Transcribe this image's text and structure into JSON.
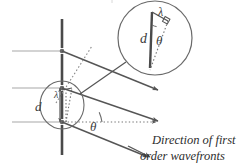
{
  "figure": {
    "kind": "optics-diagram",
    "background_color": "#ffffff",
    "ink_color": "#555555",
    "grating_color": "#4a4a4a",
    "wavefront_color": "#bdbdbd",
    "text_color": "#3c3c3c"
  },
  "labels": {
    "slit_spacing_small": "d",
    "wavelength_small": "λ",
    "slit_spacing_magnified": "d",
    "angle_magnified": "θ",
    "wavelength_magnified": "λ",
    "angle_main": "θ"
  },
  "caption": {
    "line1": "Direction of first",
    "line2": "order wavefronts"
  },
  "geometry": {
    "grating_line": {
      "x": 62,
      "y1": 20,
      "y2": 155
    },
    "slit_points_y": [
      51,
      88,
      122
    ],
    "incoming_wavefronts_y": [
      51,
      88,
      122
    ],
    "incoming_wavefront_x_start": 12,
    "incoming_wavefront_x_end": 62,
    "detail_circle_small": {
      "cx": 62,
      "cy": 105,
      "rx": 22,
      "ry": 24
    },
    "detail_circle_large": {
      "cx": 155,
      "cy": 38,
      "r": 37
    },
    "diffraction_angle_deg": 22,
    "ray_arrow_endpoints": [
      {
        "x": 160,
        "y": 91
      },
      {
        "x": 160,
        "y": 122
      },
      {
        "x": 150,
        "y": 158
      }
    ],
    "reference_dotted_line": {
      "x1": 62,
      "y1": 122,
      "x2": 158,
      "y2": 122
    }
  }
}
